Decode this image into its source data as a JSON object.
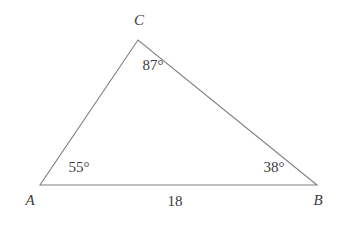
{
  "figure": {
    "type": "geometry-diagram",
    "shape": "triangle",
    "background_color": "#ffffff",
    "stroke_color": "#808080",
    "text_color": "#3b3b3b",
    "stroke_width": 1.1,
    "width": 347,
    "height": 227
  },
  "vertices": [
    {
      "name": "A",
      "label": "A",
      "x": 40,
      "y": 185,
      "label_x": 30,
      "label_y": 200
    },
    {
      "name": "B",
      "label": "B",
      "x": 317,
      "y": 185,
      "label_x": 318,
      "label_y": 200
    },
    {
      "name": "C",
      "label": "C",
      "x": 138,
      "y": 40,
      "label_x": 139,
      "label_y": 20
    }
  ],
  "angles": [
    {
      "at_vertex": "A",
      "label": "55°",
      "value": 55,
      "unit": "degrees",
      "label_x": 79,
      "label_y": 167
    },
    {
      "at_vertex": "B",
      "label": "38°",
      "value": 38,
      "unit": "degrees",
      "label_x": 274,
      "label_y": 167
    },
    {
      "at_vertex": "C",
      "label": "87°",
      "value": 87,
      "unit": "degrees",
      "label_x": 153,
      "label_y": 65
    }
  ],
  "sides": [
    {
      "name": "AB",
      "label": "18",
      "value": 18,
      "from": "A",
      "to": "B",
      "label_x": 175,
      "label_y": 201
    }
  ]
}
